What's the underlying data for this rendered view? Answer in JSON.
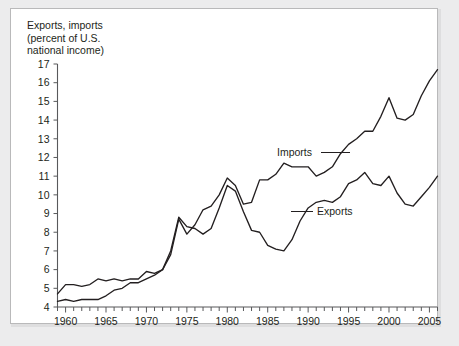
{
  "figure": {
    "title": "Exports, imports\n(percent of U.S.\nnational income)",
    "background_color": "#ececed",
    "panel_color": "#ffffff",
    "line_color": "#231f20",
    "axis_color": "#58595b"
  },
  "annotations": {
    "imports_label": "Imports",
    "exports_label": "Exports"
  },
  "chart_data": {
    "type": "line",
    "title": "Exports, imports (percent of U.S. national income)",
    "xlabel": "",
    "ylabel": "Exports, imports (percent of U.S. national income)",
    "xlim": [
      1959,
      2006
    ],
    "ylim": [
      4,
      17
    ],
    "ytick_labels": [
      "4",
      "5",
      "6",
      "7",
      "8",
      "9",
      "10",
      "11",
      "12",
      "13",
      "14",
      "15",
      "16",
      "17"
    ],
    "yticks": [
      4,
      5,
      6,
      7,
      8,
      9,
      10,
      11,
      12,
      13,
      14,
      15,
      16,
      17
    ],
    "xtick_labels": [
      "1960",
      "1965",
      "1970",
      "1975",
      "1980",
      "1985",
      "1990",
      "1995",
      "2000",
      "2005"
    ],
    "xticks": [
      1960,
      1965,
      1970,
      1975,
      1980,
      1985,
      1990,
      1995,
      2000,
      2005
    ],
    "minor_xticks_every": 1,
    "grid": false,
    "legend": "inline-annotations",
    "x": [
      1959,
      1960,
      1961,
      1962,
      1963,
      1964,
      1965,
      1966,
      1967,
      1968,
      1969,
      1970,
      1971,
      1972,
      1973,
      1974,
      1975,
      1976,
      1977,
      1978,
      1979,
      1980,
      1981,
      1982,
      1983,
      1984,
      1985,
      1986,
      1987,
      1988,
      1989,
      1990,
      1991,
      1992,
      1993,
      1994,
      1995,
      1996,
      1997,
      1998,
      1999,
      2000,
      2001,
      2002,
      2003,
      2004,
      2005,
      2006
    ],
    "series": [
      {
        "name": "Exports",
        "values": [
          4.7,
          5.2,
          5.2,
          5.1,
          5.2,
          5.5,
          5.4,
          5.5,
          5.4,
          5.5,
          5.5,
          5.9,
          5.8,
          6.0,
          7.0,
          8.8,
          8.3,
          8.2,
          7.9,
          8.2,
          9.3,
          10.5,
          10.2,
          9.1,
          8.1,
          8.0,
          7.3,
          7.1,
          7.0,
          7.6,
          8.6,
          9.3,
          9.6,
          9.7,
          9.6,
          9.9,
          10.6,
          10.8,
          11.2,
          10.6,
          10.5,
          11.0,
          10.1,
          9.5,
          9.4,
          9.9,
          10.4,
          11.0
        ]
      },
      {
        "name": "Imports",
        "values": [
          4.3,
          4.4,
          4.3,
          4.4,
          4.4,
          4.4,
          4.6,
          4.9,
          5.0,
          5.3,
          5.3,
          5.5,
          5.7,
          6.0,
          6.8,
          8.7,
          7.9,
          8.4,
          9.2,
          9.4,
          10.0,
          10.9,
          10.5,
          9.5,
          9.6,
          10.8,
          10.8,
          11.1,
          11.7,
          11.5,
          11.5,
          11.5,
          11.0,
          11.2,
          11.5,
          12.2,
          12.7,
          13.0,
          13.4,
          13.4,
          14.2,
          15.2,
          14.1,
          14.0,
          14.3,
          15.3,
          16.1,
          16.7
        ]
      }
    ]
  }
}
